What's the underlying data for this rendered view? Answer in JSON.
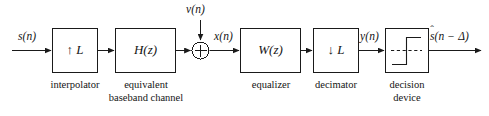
{
  "figure": {
    "type": "block-diagram",
    "background_color": "#ffffff",
    "line_color": "#1a1a1a"
  },
  "signals": {
    "input": "s(n)",
    "noise": "ν(n)",
    "after_sum": "x(n)",
    "after_decimator": "y(n)",
    "output_shat": "s",
    "output_hat": "ˆ",
    "output_rest": "(n − Δ)"
  },
  "blocks": [
    {
      "id": "interpolator",
      "label": "↑ L",
      "caption_line1": "interpolator",
      "caption_line2": ""
    },
    {
      "id": "channel",
      "label": "H(z)",
      "caption_line1": "equivalent",
      "caption_line2": "baseband channel"
    },
    {
      "id": "equalizer",
      "label": "W(z)",
      "caption_line1": "equalizer",
      "caption_line2": ""
    },
    {
      "id": "decimator",
      "label": "↓ L",
      "caption_line1": "decimator",
      "caption_line2": ""
    },
    {
      "id": "decision-device",
      "label": "",
      "caption_line1": "decision",
      "caption_line2": "device"
    }
  ],
  "adder": {
    "symbol": "cross-in-circle",
    "operation": "sum"
  }
}
